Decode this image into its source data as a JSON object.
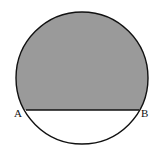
{
  "diagram": {
    "type": "circle-segment",
    "shade_color": "#9a9a9a",
    "stroke_color": "#111111",
    "circle": {
      "cx": 82,
      "cy": 78,
      "r": 66
    },
    "chord": {
      "y": 110
    },
    "points": [
      {
        "label": "A",
        "x": 14,
        "y": 116
      },
      {
        "label": "B",
        "x": 141,
        "y": 116
      }
    ]
  }
}
